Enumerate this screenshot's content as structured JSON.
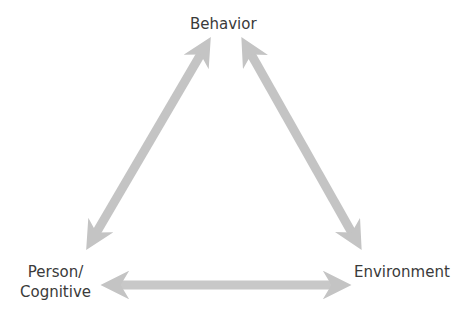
{
  "diagram": {
    "nodes": {
      "behavior": "Behavior",
      "person_line1": "Person/",
      "person_line2": "Cognitive",
      "environment": "Environment"
    },
    "edges": [
      {
        "from": "Person/Cognitive",
        "to": "Behavior",
        "direction": "bidirectional"
      },
      {
        "from": "Behavior",
        "to": "Environment",
        "direction": "bidirectional"
      },
      {
        "from": "Person/Cognitive",
        "to": "Environment",
        "direction": "bidirectional"
      }
    ],
    "colors": {
      "arrow": "#c4c4c4",
      "text": "#3a3a3a",
      "background": "#ffffff"
    }
  }
}
